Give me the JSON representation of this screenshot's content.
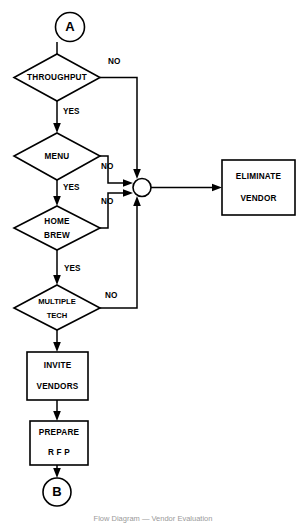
{
  "figure": {
    "kind": "flowchart",
    "caption": "Flow Diagram — Vendor Evaluation",
    "background_color": "#ffffff",
    "line_color": "#000000",
    "text_color": "#000000"
  },
  "nodes": {
    "entry_connector": {
      "label": "A",
      "shape": "circle"
    },
    "decision_throughput": {
      "label": "THROUGHPUT",
      "shape": "diamond"
    },
    "decision_menu": {
      "label": "MENU",
      "shape": "diamond"
    },
    "decision_home_brew": {
      "label_line1": "HOME",
      "label_line2": "BREW",
      "shape": "diamond"
    },
    "decision_multiple_tech": {
      "label_line1": "MULTIPLE",
      "label_line2": "TECH",
      "shape": "diamond"
    },
    "junction": {
      "label": "",
      "shape": "small-circle"
    },
    "process_eliminate_vendor": {
      "label_line1": "ELIMINATE",
      "label_line2": "VENDOR",
      "shape": "rectangle"
    },
    "process_invite_vendors": {
      "label_line1": "INVITE",
      "label_line2": "VENDORS",
      "shape": "rectangle"
    },
    "process_prepare_rfp": {
      "label_line1": "PREPARE",
      "label_line2": "R F P",
      "shape": "rectangle"
    },
    "exit_connector": {
      "label": "B",
      "shape": "circle"
    }
  },
  "edge_labels": {
    "throughput_no": "NO",
    "throughput_yes": "YES",
    "menu_no": "NO",
    "menu_yes": "YES",
    "home_brew_no": "NO",
    "home_brew_yes": "YES",
    "multiple_tech_no": "NO"
  }
}
